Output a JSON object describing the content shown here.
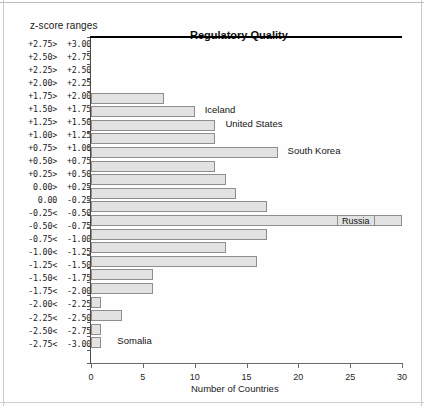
{
  "chart_data": {
    "type": "bar",
    "orientation": "horizontal",
    "title": "Regulatory Quality",
    "xlabel": "Number of Countries",
    "ylabel": "z-score ranges",
    "xlim": [
      0,
      30
    ],
    "xticks": [
      0,
      5,
      10,
      15,
      20,
      25,
      30
    ],
    "xtick_labels": [
      "0",
      "5",
      "10",
      "15",
      "20",
      "25",
      "30"
    ],
    "grid": false,
    "legend": "none",
    "zero_reference_line_after_category": "0.00> +0.25",
    "categories": [
      "+2.75> +3.00",
      "+2.50> +2.75",
      "+2.25> +2.50",
      "+2.00> +2.25",
      "+1.75> +2.00",
      "+1.50> +1.75",
      "+1.25> +1.50",
      "+1.00> +1.25",
      "+0.75> +1.00",
      "+0.50> +0.75",
      "+0.25> +0.50",
      " 0.00> +0.25",
      " 0.00  -0.25",
      "-0.25< -0.50",
      "-0.50< -0.75",
      "-0.75< -1.00",
      "-1.00< -1.25",
      "-1.25< -1.50",
      "-1.50< -1.75",
      "-1.75< -2.00",
      "-2.00< -2.25",
      "-2.25< -2.50",
      "-2.50< -2.75",
      "-2.75< -3.00"
    ],
    "category_parts": [
      {
        "lo": "+2.75>",
        "hi": "+3.00"
      },
      {
        "lo": "+2.50>",
        "hi": "+2.75"
      },
      {
        "lo": "+2.25>",
        "hi": "+2.50"
      },
      {
        "lo": "+2.00>",
        "hi": "+2.25"
      },
      {
        "lo": "+1.75>",
        "hi": "+2.00"
      },
      {
        "lo": "+1.50>",
        "hi": "+1.75"
      },
      {
        "lo": "+1.25>",
        "hi": "+1.50"
      },
      {
        "lo": "+1.00>",
        "hi": "+1.25"
      },
      {
        "lo": "+0.75>",
        "hi": "+1.00"
      },
      {
        "lo": "+0.50>",
        "hi": "+0.75"
      },
      {
        "lo": "+0.25>",
        "hi": "+0.50"
      },
      {
        "lo": "0.00>",
        "hi": "+0.25"
      },
      {
        "lo": "0.00",
        "hi": "-0.25"
      },
      {
        "lo": "-0.25<",
        "hi": "-0.50"
      },
      {
        "lo": "-0.50<",
        "hi": "-0.75"
      },
      {
        "lo": "-0.75<",
        "hi": "-1.00"
      },
      {
        "lo": "-1.00<",
        "hi": "-1.25"
      },
      {
        "lo": "-1.25<",
        "hi": "-1.50"
      },
      {
        "lo": "-1.50<",
        "hi": "-1.75"
      },
      {
        "lo": "-1.75<",
        "hi": "-2.00"
      },
      {
        "lo": "-2.00<",
        "hi": "-2.25"
      },
      {
        "lo": "-2.25<",
        "hi": "-2.50"
      },
      {
        "lo": "-2.50<",
        "hi": "-2.75"
      },
      {
        "lo": "-2.75<",
        "hi": "-3.00"
      }
    ],
    "values": [
      0,
      0,
      0,
      0,
      7,
      10,
      12,
      12,
      18,
      12,
      13,
      14,
      17,
      30,
      17,
      13,
      16,
      6,
      6,
      1,
      3,
      1,
      1,
      0
    ],
    "bar_fill_color": "#e2e2e2",
    "bar_border_color": "#8e8e8e",
    "zero_line_color": "#000000",
    "annotations": [
      {
        "text": "Iceland",
        "category": "+1.50> +1.75",
        "boxed": false
      },
      {
        "text": "United States",
        "category": "+1.25> +1.50",
        "boxed": false
      },
      {
        "text": "South Korea",
        "category": "+0.75> +1.00",
        "boxed": false
      },
      {
        "text": "Russia",
        "category": "-0.25< -0.50",
        "boxed": true
      },
      {
        "text": "Somalia",
        "category": "-2.50< -2.75",
        "boxed": false
      }
    ]
  }
}
